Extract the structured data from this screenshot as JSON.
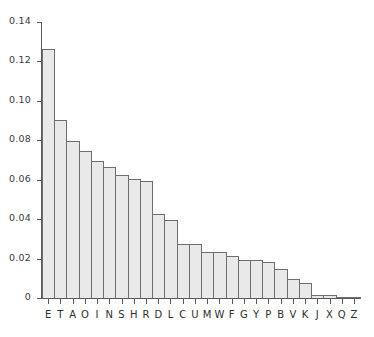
{
  "chart_data": {
    "type": "bar",
    "title": "",
    "subtitle": "",
    "xlabel": "",
    "ylabel": "",
    "categories": [
      "E",
      "T",
      "A",
      "O",
      "I",
      "N",
      "S",
      "H",
      "R",
      "D",
      "L",
      "C",
      "U",
      "M",
      "W",
      "F",
      "G",
      "Y",
      "P",
      "B",
      "V",
      "K",
      "J",
      "X",
      "Q",
      "Z"
    ],
    "values": [
      0.127,
      0.091,
      0.08,
      0.075,
      0.07,
      0.067,
      0.063,
      0.061,
      0.06,
      0.043,
      0.04,
      0.028,
      0.028,
      0.024,
      0.024,
      0.022,
      0.02,
      0.02,
      0.019,
      0.015,
      0.01,
      0.008,
      0.002,
      0.002,
      0.001,
      0.001
    ],
    "ylim": [
      0,
      0.14
    ],
    "xlim_categories": 26,
    "yticks": [
      0,
      0.02,
      0.04,
      0.06,
      0.08,
      0.1,
      0.12,
      0.14
    ],
    "ytick_labels": [
      "0",
      "0.02",
      "0.04",
      "0.06",
      "0.08",
      "0.10",
      "0.12",
      "0.14"
    ],
    "grid": false,
    "legend": false,
    "legend_position": "none",
    "bar_fill_color": "#e9e9e9",
    "bar_edge_color": "#6d6d6d",
    "axis_color": "#5a5a5a",
    "background_color": "#ffffff",
    "annotations": []
  }
}
